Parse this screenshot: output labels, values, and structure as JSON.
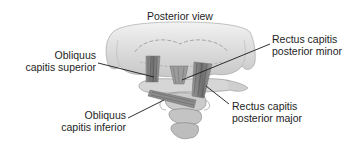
{
  "diagram": {
    "title": "Posterior view",
    "labels": [
      {
        "id": "obliquus-capitis-superior",
        "line1": "Obliquus",
        "line2": "capitis superior"
      },
      {
        "id": "rectus-capitis-posterior-minor",
        "line1": "Rectus capitis",
        "line2": "posterior minor"
      },
      {
        "id": "obliquus-capitis-inferior",
        "line1": "Obliquus",
        "line2": "capitis inferior"
      },
      {
        "id": "rectus-capitis-posterior-major",
        "line1": "Rectus capitis",
        "line2": "posterior major"
      }
    ],
    "colors": {
      "background": "#ffffff",
      "text": "#1e1e1e",
      "skull": "#d9d9d9",
      "muscle": "#8a8a8a",
      "bone": "#c4c4c4",
      "leader_line": "#1a1a1a"
    }
  }
}
